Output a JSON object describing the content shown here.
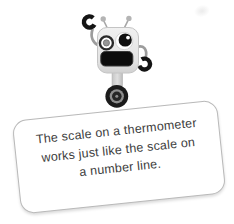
{
  "card": {
    "lines": [
      "The scale on a thermometer",
      "works just like the scale on",
      "a number line."
    ],
    "background": "#ffffff",
    "border_color": "#b9b9b9",
    "text_color": "#3d3d3d"
  },
  "robot": {
    "name": "robot-mascot",
    "parts": [
      "antenna-left",
      "antenna-right",
      "claw-left",
      "claw-right",
      "arm-left",
      "arm-right",
      "eye-left",
      "eye-right",
      "mouth",
      "neck",
      "wheel"
    ],
    "colors": {
      "body": "#e4e4e4",
      "black_details": "#111111",
      "metal_gray": "#9c9c9c",
      "wheel_ring": "#8e8e8e"
    }
  }
}
